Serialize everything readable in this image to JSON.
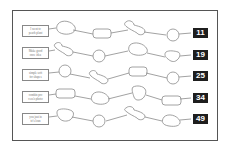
{
  "puzzle": {
    "rows": [
      {
        "label_lines": [
          "I went to",
          "peach plant"
        ],
        "answer": "11"
      },
      {
        "label_lines": [
          "Make good",
          "once idea"
        ],
        "answer": "19"
      },
      {
        "label_lines": [
          "simple soft",
          "for shapes"
        ],
        "answer": "25"
      },
      {
        "label_lines": [
          "combin pro",
          "cess's photo"
        ],
        "answer": "34"
      },
      {
        "label_lines": [
          "you just in",
          "to's loan"
        ],
        "answer": "49"
      }
    ]
  },
  "colors": {
    "stroke": "#8a8a8a",
    "badge_bg": "#1e1e1e",
    "badge_text": "#ffffff"
  }
}
